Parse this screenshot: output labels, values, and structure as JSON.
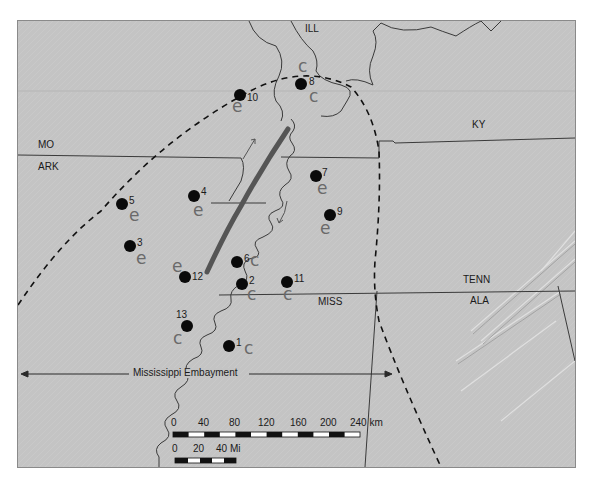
{
  "map": {
    "states": [
      {
        "id": "ill",
        "label": "ILL",
        "x": 305,
        "y": 28
      },
      {
        "id": "mo",
        "label": "MO",
        "x": 38,
        "y": 140
      },
      {
        "id": "ark",
        "label": "ARK",
        "x": 38,
        "y": 162
      },
      {
        "id": "ky",
        "label": "KY",
        "x": 472,
        "y": 120
      },
      {
        "id": "tenn",
        "label": "TENN",
        "x": 463,
        "y": 275
      },
      {
        "id": "miss",
        "label": "MISS",
        "x": 318,
        "y": 297
      },
      {
        "id": "ala",
        "label": "ALA",
        "x": 470,
        "y": 296
      }
    ],
    "sites": [
      {
        "num": "1",
        "x": 229,
        "y": 346,
        "mark": "c",
        "mark_x": 244,
        "mark_y": 342
      },
      {
        "num": "2",
        "x": 242,
        "y": 284,
        "mark": "c",
        "mark_x": 247,
        "mark_y": 290
      },
      {
        "num": "3",
        "x": 130,
        "y": 246,
        "mark": "e",
        "mark_x": 136,
        "mark_y": 251
      },
      {
        "num": "4",
        "x": 194,
        "y": 196,
        "mark": "e",
        "mark_x": 193,
        "mark_y": 203
      },
      {
        "num": "5",
        "x": 122,
        "y": 204,
        "mark": "e",
        "mark_x": 129,
        "mark_y": 210
      },
      {
        "num": "6",
        "x": 237,
        "y": 262,
        "mark": "c",
        "mark_x": 249,
        "mark_y": 254
      },
      {
        "num": "7",
        "x": 316,
        "y": 176,
        "mark": "e",
        "mark_x": 317,
        "mark_y": 182
      },
      {
        "num": "8",
        "x": 301,
        "y": 84,
        "mark": "c",
        "mark_x": 298,
        "mark_y": 63
      },
      {
        "num": "9",
        "x": 330,
        "y": 215,
        "mark": "e",
        "mark_x": 321,
        "mark_y": 222
      },
      {
        "num": "10",
        "x": 240,
        "y": 95,
        "mark": "e",
        "mark_x": 232,
        "mark_y": 101
      },
      {
        "num": "11",
        "x": 287,
        "y": 282,
        "mark": "c",
        "mark_x": 283,
        "mark_y": 287
      },
      {
        "num": "12",
        "x": 185,
        "y": 277,
        "mark": "e",
        "mark_x": 173,
        "mark_y": 258
      },
      {
        "num": "13",
        "x": 187,
        "y": 326,
        "mark": "c",
        "mark_x": 174,
        "mark_y": 332
      }
    ],
    "extra_marks": [
      {
        "mark": "c",
        "x": 309,
        "y": 92
      }
    ],
    "embayment_label": "Mississippi Embayment",
    "scale_km": {
      "ticks": [
        "0",
        "40",
        "80",
        "120",
        "160",
        "200",
        "240 km"
      ],
      "tick_x": [
        172,
        200,
        232,
        260,
        292,
        322,
        350
      ]
    },
    "scale_mi": {
      "ticks": [
        "0",
        "20",
        "40 Mi"
      ],
      "tick_x": [
        172,
        194,
        217
      ]
    },
    "colors": {
      "background": "#c4c4c4",
      "border_lines": "#3a3a3a",
      "fault_zone": "#555555",
      "dots": "#0a0a0a",
      "handwriting": "#6a6a6a"
    }
  }
}
